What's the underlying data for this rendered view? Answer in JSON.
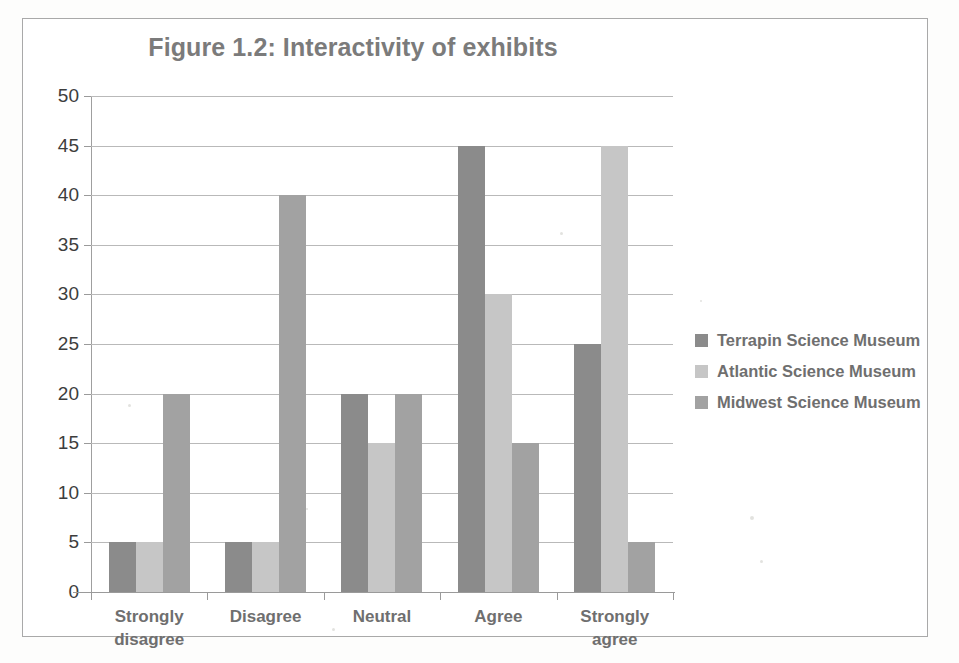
{
  "chart_data": {
    "type": "bar",
    "title": "Figure 1.2: Interactivity of exhibits",
    "xlabel": "",
    "ylabel": "",
    "ylim": [
      0,
      50
    ],
    "yticks": [
      0,
      5,
      10,
      15,
      20,
      25,
      30,
      35,
      40,
      45,
      50
    ],
    "grid": true,
    "legend_position": "right",
    "categories": [
      "Strongly disagree",
      "Disagree",
      "Neutral",
      "Agree",
      "Strongly agree"
    ],
    "category_lines": [
      [
        "Strongly",
        "disagree"
      ],
      [
        "Disagree",
        ""
      ],
      [
        "Neutral",
        ""
      ],
      [
        "Agree",
        ""
      ],
      [
        "Strongly",
        "agree"
      ]
    ],
    "series": [
      {
        "name": "Terrapin Science Museum",
        "color": "#8b8b8b",
        "values": [
          5,
          5,
          20,
          45,
          25
        ]
      },
      {
        "name": "Atlantic Science Museum",
        "color": "#c6c6c6",
        "values": [
          5,
          5,
          15,
          30,
          45
        ]
      },
      {
        "name": "Midwest Science Museum",
        "color": "#a2a2a2",
        "values": [
          20,
          40,
          20,
          15,
          5
        ]
      }
    ]
  },
  "legend": {
    "items": [
      {
        "label": "Terrapin Science Museum",
        "color": "#8b8b8b"
      },
      {
        "label": "Atlantic Science Museum",
        "color": "#c6c6c6"
      },
      {
        "label": "Midwest Science Museum",
        "color": "#a2a2a2"
      }
    ]
  },
  "colors": {
    "title_text": "#7b7b7b",
    "axis_text": "#3d3d3d",
    "label_text": "#6f6f6f",
    "gridline": "#b9b9b9",
    "frame_border": "#a9a9a9",
    "background": "#ffffff"
  }
}
